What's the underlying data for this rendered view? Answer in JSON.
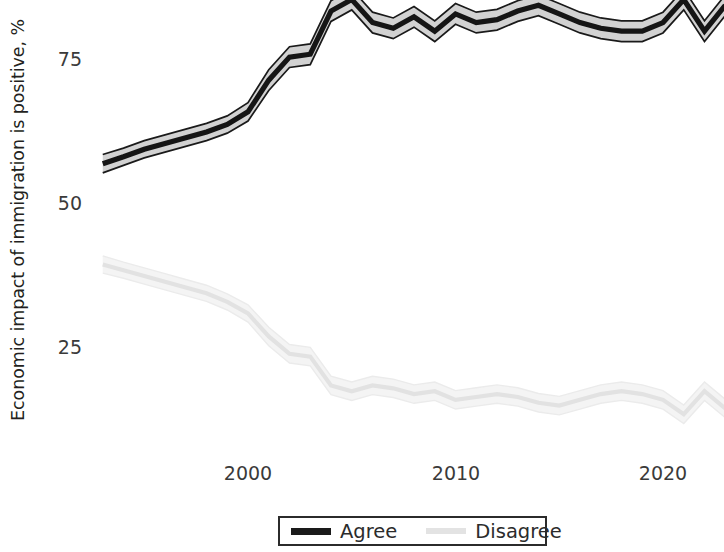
{
  "chart_data": {
    "type": "line",
    "title": "",
    "subtitle": "",
    "xlabel": "",
    "ylabel": "Economic impact of immigration is positive, %",
    "xlim": [
      1992.5,
      2023.5
    ],
    "ylim": [
      4,
      88
    ],
    "grid": false,
    "legend_position": "bottom-center",
    "xticks": [
      2000,
      2010,
      2020
    ],
    "xtick_labels": [
      "2000",
      "2010",
      "2020"
    ],
    "yticks": [
      25,
      50,
      75
    ],
    "ytick_labels": [
      "25",
      "50",
      "75"
    ],
    "note": "Lines drawn with shaded confidence bands; top of Agree series is clipped by the image crop",
    "x": [
      1993,
      1994,
      1995,
      1996,
      1997,
      1998,
      1999,
      2000,
      2001,
      2002,
      2003,
      2004,
      2005,
      2006,
      2007,
      2008,
      2009,
      2010,
      2011,
      2012,
      2013,
      2014,
      2015,
      2016,
      2017,
      2018,
      2019,
      2020,
      2021,
      2022,
      2023
    ],
    "series": [
      {
        "name": "Agree",
        "color": "#1a1a1a",
        "band_color": "#c9c9c9",
        "values": [
          57.0,
          58.2,
          59.5,
          60.5,
          61.5,
          62.5,
          63.8,
          66.0,
          71.5,
          75.5,
          76.0,
          83.5,
          85.5,
          81.5,
          80.5,
          82.5,
          80.0,
          83.0,
          81.5,
          82.0,
          83.5,
          84.5,
          83.0,
          81.5,
          80.5,
          80.0,
          80.0,
          81.5,
          85.5,
          80.0,
          84.5
        ],
        "ci_halfwidth": [
          1.6,
          1.5,
          1.5,
          1.5,
          1.5,
          1.5,
          1.5,
          1.6,
          1.8,
          1.8,
          1.8,
          1.8,
          1.8,
          1.8,
          1.8,
          1.8,
          1.8,
          1.8,
          1.8,
          1.8,
          1.8,
          1.8,
          1.8,
          1.8,
          1.8,
          1.8,
          1.8,
          1.8,
          1.8,
          1.8,
          1.8
        ]
      },
      {
        "name": "Disagree",
        "color": "#e0e0e0",
        "band_color": "#f2f2f2",
        "values": [
          39.5,
          38.5,
          37.5,
          36.5,
          35.5,
          34.5,
          33.0,
          31.0,
          27.0,
          24.0,
          23.5,
          18.5,
          17.5,
          18.5,
          18.0,
          17.0,
          17.5,
          16.0,
          16.5,
          17.0,
          16.5,
          15.5,
          15.0,
          16.0,
          17.0,
          17.5,
          17.0,
          16.0,
          13.5,
          17.5,
          14.5
        ],
        "ci_halfwidth": [
          1.5,
          1.4,
          1.4,
          1.4,
          1.4,
          1.4,
          1.4,
          1.5,
          1.6,
          1.6,
          1.6,
          1.6,
          1.6,
          1.6,
          1.6,
          1.6,
          1.6,
          1.6,
          1.6,
          1.6,
          1.6,
          1.6,
          1.6,
          1.6,
          1.6,
          1.6,
          1.6,
          1.6,
          1.6,
          1.6,
          1.6
        ]
      }
    ]
  },
  "legend": {
    "agree_label": "Agree",
    "disagree_label": "Disagree"
  },
  "axis": {
    "y_title": "Economic impact of immigration is positive, %",
    "y_tick_75": "75",
    "y_tick_50": "50",
    "y_tick_25": "25",
    "x_tick_2000": "2000",
    "x_tick_2010": "2010",
    "x_tick_2020": "2020"
  }
}
